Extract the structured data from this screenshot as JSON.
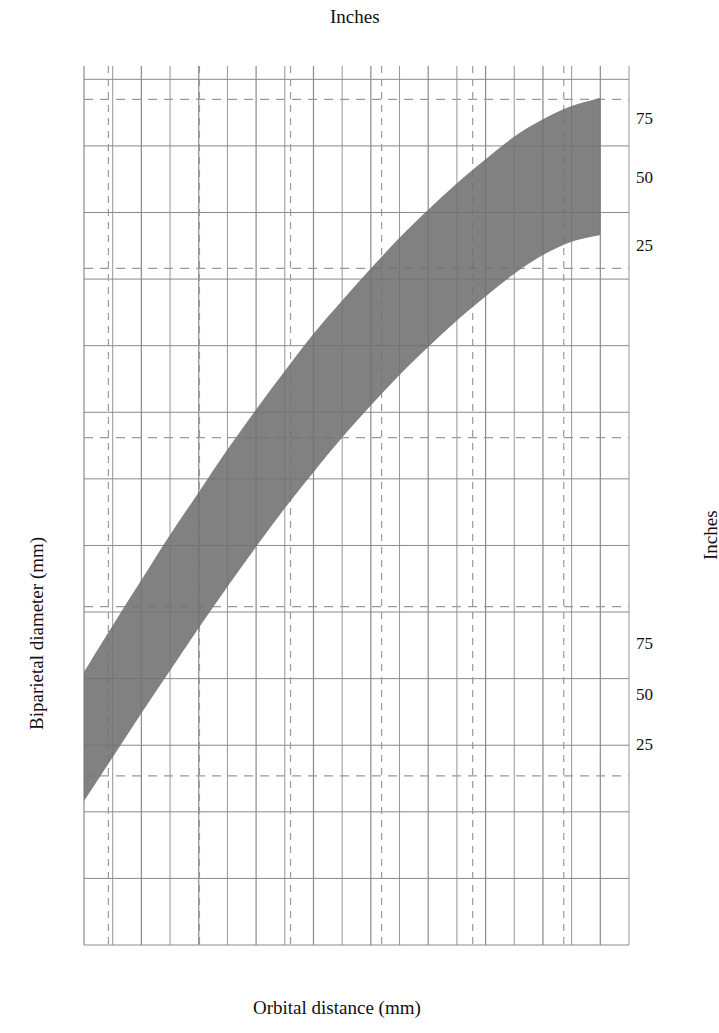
{
  "figure": {
    "title_top_axis": "Inches",
    "title_bottom_axis": "Orbital distance (mm)",
    "title_left_axis": "Biparietal diameter (mm)",
    "title_right_axis": "Inches"
  },
  "band_labels": {
    "outer": "Outer orbit",
    "inner": "Inner orbit"
  },
  "percentile_labels": {
    "outer": [
      "75",
      "50",
      "25"
    ],
    "inner": [
      "75",
      "50",
      "25"
    ]
  },
  "axes": {
    "bottom_ticks": [
      "22",
      "30",
      "38",
      "46",
      "54",
      "62",
      "70",
      "78",
      "86",
      "94"
    ],
    "left_ticks": [
      "0",
      "5",
      "10",
      "15",
      "20",
      "25",
      "30",
      "35",
      "40",
      "45",
      "50",
      "55",
      "60",
      "65"
    ],
    "top_ticks": [
      "1.0",
      "1.5",
      "2.0",
      "2.5",
      "3.0",
      "3.5"
    ],
    "right_ticks": [
      "0.5",
      "1.0",
      "1.5",
      "2.0",
      "2.5"
    ]
  },
  "chart_data": {
    "type": "line",
    "title": "",
    "xlabel": "Orbital distance (mm)",
    "ylabel": "Biparietal diameter (mm)",
    "xlabel_secondary": "Inches",
    "ylabel_secondary": "Inches",
    "xlim": [
      22,
      98
    ],
    "ylim": [
      0,
      66
    ],
    "xlim_inches": [
      0.866,
      3.858
    ],
    "ylim_inches": [
      0,
      2.598
    ],
    "grid": true,
    "legend": "inline-annotations",
    "x_major_step": 8,
    "x_minor_step": 4,
    "y_major_step": 5,
    "x_inch_gridlines": [
      1.0,
      1.5,
      2.0,
      2.5,
      3.0,
      3.5
    ],
    "y_inch_gridlines": [
      0.5,
      1.0,
      1.5,
      2.0,
      2.5
    ],
    "x": [
      22,
      26,
      30,
      34,
      38,
      42,
      46,
      50,
      54,
      58,
      62,
      66,
      70,
      74,
      78,
      82,
      86,
      90,
      94
    ],
    "series": [
      {
        "name": "Outer orbit 75th percentile",
        "group": "Outer orbit",
        "percentile": 75,
        "values": [
          20.5,
          24.0,
          27.4,
          30.8,
          34.0,
          37.2,
          40.2,
          43.1,
          45.9,
          48.4,
          50.8,
          53.1,
          55.2,
          57.2,
          59.0,
          60.7,
          62.0,
          63.0,
          63.6
        ]
      },
      {
        "name": "Outer orbit 50th percentile",
        "group": "Outer orbit",
        "percentile": 50,
        "values": [
          15.5,
          18.9,
          22.3,
          25.6,
          28.8,
          31.9,
          34.9,
          37.8,
          40.5,
          43.1,
          45.5,
          47.8,
          49.9,
          51.9,
          53.7,
          55.4,
          56.8,
          57.8,
          58.4
        ]
      },
      {
        "name": "Outer orbit 25th percentile",
        "group": "Outer orbit",
        "percentile": 25,
        "values": [
          10.8,
          14.1,
          17.4,
          20.6,
          23.8,
          26.9,
          29.9,
          32.8,
          35.5,
          38.1,
          40.5,
          42.8,
          44.9,
          46.9,
          48.7,
          50.4,
          51.8,
          52.8,
          53.3
        ]
      },
      {
        "name": "Inner orbit 75th percentile",
        "group": "Inner orbit",
        "percentile": 75,
        "values": [
          9.0,
          10.2,
          11.4,
          12.5,
          13.6,
          14.6,
          15.6,
          16.5,
          17.4,
          18.2,
          19.0,
          19.7,
          20.4,
          21.0,
          21.5,
          21.9,
          22.2,
          22.4,
          22.5
        ]
      },
      {
        "name": "Inner orbit 50th percentile",
        "group": "Inner orbit",
        "percentile": 50,
        "values": [
          5.5,
          6.7,
          7.9,
          9.0,
          10.1,
          11.2,
          12.2,
          13.1,
          14.0,
          14.8,
          15.6,
          16.3,
          17.0,
          17.6,
          18.1,
          18.4,
          18.6,
          18.75,
          18.8
        ]
      },
      {
        "name": "Inner orbit 25th percentile",
        "group": "Inner orbit",
        "percentile": 25,
        "values": [
          2.4,
          3.5,
          4.6,
          5.7,
          6.8,
          7.8,
          8.8,
          9.7,
          10.6,
          11.4,
          12.2,
          12.9,
          13.6,
          14.1,
          14.6,
          14.9,
          15.1,
          15.15,
          15.2
        ]
      }
    ],
    "bands": [
      {
        "name": "Outer orbit",
        "lower": "Outer orbit 25th percentile",
        "upper": "Outer orbit 75th percentile",
        "fill": "#6f6f6f"
      },
      {
        "name": "Inner orbit",
        "lower": "Inner orbit 25th percentile",
        "upper": "Inner orbit 75th percentile",
        "fill": "#6f6f6f"
      }
    ],
    "colors": {
      "band_fill": "#6f6f6f",
      "median_line": "#000000",
      "grid_solid": "#8a8a8a",
      "grid_dashed": "#9a9a9a",
      "frame": "#000000"
    }
  }
}
